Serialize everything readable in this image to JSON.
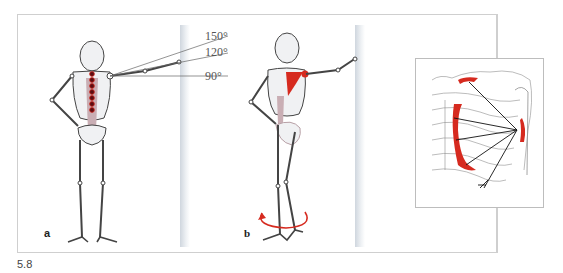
{
  "figure_number": "5.8",
  "panels": {
    "a": {
      "label": "a",
      "angles": [
        "150°",
        "120°",
        "90°"
      ]
    },
    "b": {
      "label": "b"
    }
  },
  "colors": {
    "muscle": "#d62a1f",
    "bone": "#f0f1f3",
    "outline": "#444444",
    "spine_shadow": "#c9aeb4",
    "rotation_arrow": "#d62a1f"
  }
}
